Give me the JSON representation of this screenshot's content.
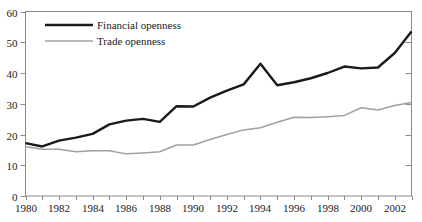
{
  "chart_data": {
    "type": "line",
    "title": "",
    "xlabel": "",
    "ylabel": "",
    "xlim": [
      1980,
      2003
    ],
    "ylim": [
      0,
      60
    ],
    "grid": false,
    "legend_position": "top-left",
    "x": [
      1980,
      1981,
      1982,
      1983,
      1984,
      1985,
      1986,
      1987,
      1988,
      1989,
      1990,
      1991,
      1992,
      1993,
      1994,
      1995,
      1996,
      1997,
      1998,
      1999,
      2000,
      2001,
      2002,
      2003
    ],
    "y_ticks": [
      0,
      10,
      20,
      30,
      40,
      50,
      60
    ],
    "y_tick_labels": [
      "0",
      "10",
      "20",
      "30",
      "40",
      "50",
      "60"
    ],
    "x_ticks": [
      1980,
      1981,
      1982,
      1983,
      1984,
      1985,
      1986,
      1987,
      1988,
      1989,
      1990,
      1991,
      1992,
      1993,
      1994,
      1995,
      1996,
      1997,
      1998,
      1999,
      2000,
      2001,
      2002,
      2003
    ],
    "x_tick_labels": [
      "1980",
      "1982",
      "1984",
      "1986",
      "1988",
      "1990",
      "1992",
      "1994",
      "1996",
      "1998",
      "2000",
      "2002"
    ],
    "x_labeled_ticks": [
      1980,
      1982,
      1984,
      1986,
      1988,
      1990,
      1992,
      1994,
      1996,
      1998,
      2000,
      2002
    ],
    "series": [
      {
        "name": "Financial openness",
        "color": "#1a1a1a",
        "width": 2.4,
        "values": [
          17.2,
          16.1,
          18.0,
          19.0,
          20.2,
          23.3,
          24.5,
          25.1,
          24.1,
          29.2,
          29.1,
          32.0,
          34.3,
          36.3,
          43.0,
          36.0,
          37.0,
          38.3,
          40.0,
          42.1,
          41.5,
          41.8,
          46.5,
          53.5
        ]
      },
      {
        "name": "Trade openness",
        "color": "#a0a0a0",
        "width": 1.5,
        "values": [
          16.0,
          15.2,
          15.2,
          14.4,
          14.7,
          14.7,
          13.7,
          14.0,
          14.4,
          16.6,
          16.6,
          18.4,
          20.0,
          21.5,
          22.2,
          24.0,
          25.6,
          25.5,
          25.8,
          26.2,
          28.7,
          28.0,
          29.4,
          30.4
        ]
      }
    ]
  },
  "legend": {
    "items": [
      {
        "label": "Financial openness",
        "color": "#1a1a1a",
        "width": 2.4
      },
      {
        "label": "Trade openness",
        "color": "#a0a0a0",
        "width": 1.5
      }
    ]
  },
  "axes": {
    "frame_color": "#8a8a8a"
  }
}
